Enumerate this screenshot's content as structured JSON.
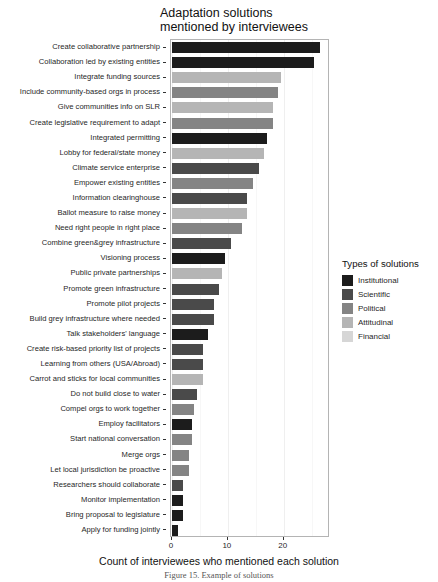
{
  "chart_data": {
    "type": "bar",
    "orientation": "horizontal",
    "title": "Adaptation solutions\nmentioned by interviewees",
    "xlabel": "Count of interviewees who mentioned each solution",
    "ylabel": "",
    "xlim": [
      0,
      28.1
    ],
    "xticks": [
      0,
      10,
      20
    ],
    "xtick_labels": [
      "0",
      "10",
      "20"
    ],
    "grid": true,
    "legend_position": "right",
    "legend_title": "Types of solutions",
    "legend_entries": [
      {
        "label": "Institutional",
        "color": "#1c1c1c"
      },
      {
        "label": "Scientific",
        "color": "#4a4a4a"
      },
      {
        "label": "Political",
        "color": "#848484"
      },
      {
        "label": "Attitudinal",
        "color": "#b5b5b5"
      },
      {
        "label": "Financial",
        "color": "#d6d6d6"
      }
    ],
    "categories": [
      "Create collaborative partnership",
      "Collaboration led by existing entities",
      "Integrate funding sources",
      "Include community-based orgs in process",
      "Give communities info on SLR",
      "Create legislative requirement to adapt",
      "Integrated permitting",
      "Lobby for federal/state money",
      "Climate service enterprise",
      "Empower existing entities",
      "Information clearinghouse",
      "Ballot measure to raise money",
      "Need right people in right place",
      "Combine green&grey infrastructure",
      "Visioning process",
      "Public private partnerships",
      "Promote green infrastructure",
      "Promote pilot projects",
      "Build grey infrastructure where needed",
      "Talk stakeholders' language",
      "Create risk-based priority list of projects",
      "Learning from others (USA/Abroad)",
      "Carrot and sticks for local communities",
      "Do not build close to water",
      "Compel orgs to work together",
      "Employ facilitators",
      "Start national conversation",
      "Merge orgs",
      "Let local jurisdiction be proactive",
      "Researchers should collaborate",
      "Monitor implementation",
      "Bring proposal to legislature",
      "Apply for funding jointly"
    ],
    "values": [
      26.5,
      25.5,
      19.5,
      19,
      18,
      18,
      17,
      16.5,
      15.5,
      14.5,
      13.5,
      13.5,
      12.5,
      10.5,
      9.5,
      9,
      8.5,
      7.5,
      7.5,
      6.5,
      5.5,
      5.5,
      5.5,
      4.5,
      4,
      3.5,
      3.5,
      3,
      3,
      2,
      2,
      2,
      1
    ],
    "value_types": [
      "Institutional",
      "Institutional",
      "Attitudinal",
      "Political",
      "Attitudinal",
      "Political",
      "Institutional",
      "Attitudinal",
      "Scientific",
      "Political",
      "Scientific",
      "Attitudinal",
      "Political",
      "Scientific",
      "Institutional",
      "Attitudinal",
      "Scientific",
      "Scientific",
      "Scientific",
      "Institutional",
      "Scientific",
      "Scientific",
      "Attitudinal",
      "Scientific",
      "Political",
      "Institutional",
      "Political",
      "Political",
      "Political",
      "Scientific",
      "Institutional",
      "Institutional",
      "Institutional"
    ]
  },
  "caption": "Figure 15. Example of solutions"
}
